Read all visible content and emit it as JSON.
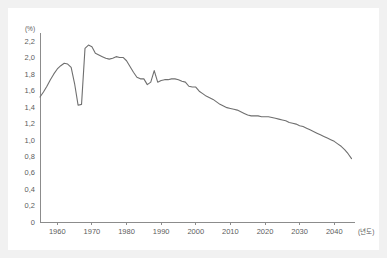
{
  "page": {
    "background_color": "#f1f1f1",
    "card_color": "#ffffff"
  },
  "colors": {
    "line": "#6f6f6f",
    "axis": "#8c8c8c",
    "text": "#5c5c5c"
  },
  "labels": {
    "y_unit": "(%)",
    "x_caption": "(년도)"
  },
  "chart_data": {
    "type": "line",
    "title": "",
    "xlabel": "(년도)",
    "ylabel": "(%)",
    "xlim": [
      1955,
      2046
    ],
    "ylim": [
      0,
      2.2
    ],
    "grid": false,
    "legend": "none",
    "x_ticks": [
      1960,
      1970,
      1980,
      1990,
      2000,
      2010,
      2020,
      2030,
      2040
    ],
    "x_tick_labels": [
      "1960",
      "1970",
      "1980",
      "1990",
      "2000",
      "2010",
      "2020",
      "2030",
      "2040"
    ],
    "y_ticks": [
      0,
      0.2,
      0.4,
      0.6,
      0.8,
      1.0,
      1.2,
      1.4,
      1.6,
      1.8,
      2.0,
      2.2
    ],
    "y_tick_labels": [
      "0",
      "0,2",
      "0,4",
      "0,6",
      "0,8",
      "1,0",
      "1,2",
      "1,4",
      "1,6",
      "1,8",
      "2,0",
      "2,2"
    ],
    "series": [
      {
        "name": "rate",
        "x": [
          1955,
          1956,
          1957,
          1958,
          1959,
          1960,
          1961,
          1962,
          1963,
          1964,
          1965,
          1966,
          1967,
          1968,
          1969,
          1970,
          1971,
          1972,
          1973,
          1974,
          1975,
          1976,
          1977,
          1978,
          1979,
          1980,
          1981,
          1982,
          1983,
          1984,
          1985,
          1986,
          1987,
          1988,
          1989,
          1990,
          1991,
          1992,
          1993,
          1994,
          1995,
          1996,
          1997,
          1998,
          1999,
          2000,
          2001,
          2002,
          2003,
          2004,
          2005,
          2006,
          2007,
          2008,
          2009,
          2010,
          2011,
          2012,
          2013,
          2014,
          2015,
          2016,
          2017,
          2018,
          2019,
          2020,
          2021,
          2022,
          2023,
          2024,
          2025,
          2026,
          2027,
          2028,
          2029,
          2030,
          2031,
          2032,
          2033,
          2034,
          2035,
          2036,
          2037,
          2038,
          2039,
          2040,
          2041,
          2042,
          2043,
          2044,
          2045
        ],
        "values": [
          1.52,
          1.58,
          1.65,
          1.73,
          1.8,
          1.86,
          1.9,
          1.93,
          1.92,
          1.88,
          1.68,
          1.42,
          1.43,
          2.11,
          2.15,
          2.13,
          2.05,
          2.03,
          2.01,
          1.99,
          1.98,
          1.99,
          2.01,
          2.0,
          2.0,
          1.96,
          1.89,
          1.82,
          1.76,
          1.74,
          1.74,
          1.67,
          1.7,
          1.84,
          1.7,
          1.72,
          1.73,
          1.73,
          1.74,
          1.74,
          1.73,
          1.71,
          1.7,
          1.65,
          1.64,
          1.64,
          1.59,
          1.56,
          1.53,
          1.51,
          1.49,
          1.46,
          1.43,
          1.41,
          1.39,
          1.38,
          1.37,
          1.36,
          1.34,
          1.32,
          1.3,
          1.29,
          1.29,
          1.29,
          1.28,
          1.28,
          1.28,
          1.27,
          1.26,
          1.25,
          1.24,
          1.23,
          1.21,
          1.2,
          1.19,
          1.17,
          1.16,
          1.14,
          1.12,
          1.1,
          1.08,
          1.06,
          1.04,
          1.02,
          1.0,
          0.98,
          0.95,
          0.92,
          0.88,
          0.83,
          0.77
        ]
      }
    ]
  }
}
